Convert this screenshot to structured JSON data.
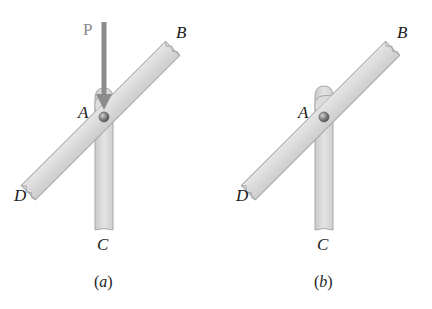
{
  "figures": [
    {
      "id": "a",
      "caption_open": "(",
      "caption_letter": "a",
      "caption_close": ")",
      "labels": {
        "A": "A",
        "B": "B",
        "C": "C",
        "D": "D"
      },
      "force": {
        "label": "P",
        "direction": "downward",
        "applied_at": "A"
      }
    },
    {
      "id": "b",
      "caption_open": "(",
      "caption_letter": "b",
      "caption_close": ")",
      "labels": {
        "A": "A",
        "B": "B",
        "C": "C",
        "D": "D"
      }
    }
  ],
  "colors": {
    "bar_fill": "#dcdcdc",
    "bar_stroke": "#a8a8a8",
    "pin": "#7a7a7a",
    "force_arrow": "#8c8c8c"
  }
}
